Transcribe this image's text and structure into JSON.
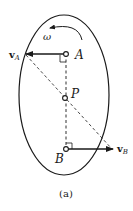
{
  "figure": {
    "caption": "(a)",
    "body_shape": "ellipse",
    "angular_velocity_label": "ω",
    "points": {
      "A": {
        "label": "A"
      },
      "P": {
        "label": "P"
      },
      "B": {
        "label": "B"
      }
    },
    "vectors": {
      "vA": {
        "symbol": "v",
        "subscript": "A"
      },
      "vB": {
        "symbol": "v",
        "subscript": "B"
      }
    },
    "colors": {
      "stroke": "#1a1a1a",
      "background": "#ffffff"
    }
  }
}
